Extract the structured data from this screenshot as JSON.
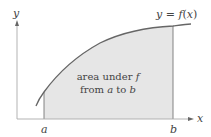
{
  "diagram": {
    "curve_label": "y = f(x)",
    "curve_label_parts": {
      "y": "y",
      "eq": " = ",
      "f": "f",
      "open": "(",
      "x": "x",
      "close": ")"
    },
    "axis_x_label": "x",
    "axis_y_label": "y",
    "bound_a_label": "a",
    "bound_b_label": "b",
    "region_label_line1": "area under f",
    "region_label_line1_parts": {
      "text": "area under ",
      "f": "f"
    },
    "region_label_line2": "from a to b",
    "region_label_line2_parts": {
      "from": "from ",
      "a": "a",
      "to": " to ",
      "b": "b"
    },
    "colors": {
      "fill": "#e6e6e6",
      "curve": "#666666",
      "axis": "#999999",
      "text": "#444444"
    }
  }
}
